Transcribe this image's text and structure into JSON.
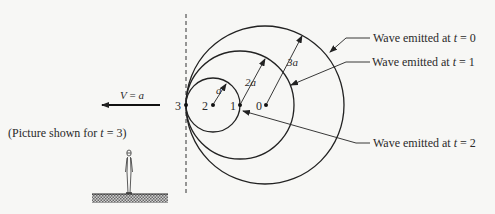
{
  "diagram": {
    "observer_line": {
      "x": 186,
      "y1": 14,
      "y2": 196
    },
    "waves": [
      {
        "t": 0,
        "center_label": "0",
        "cx": 265,
        "cy": 105,
        "r": 79,
        "radius_label": "3a",
        "caption": "Wave emitted at t = 0"
      },
      {
        "t": 1,
        "center_label": "1",
        "cx": 240,
        "cy": 105,
        "r": 54,
        "radius_label": "2a",
        "caption": "Wave emitted at t = 1"
      },
      {
        "t": 2,
        "center_label": "2",
        "cx": 213,
        "cy": 105,
        "r": 27,
        "radius_label": "a",
        "caption": "Wave emitted at t = 2"
      }
    ],
    "current_point_label": "3",
    "velocity_label": "V = a",
    "note": "(Picture shown for t = 3)",
    "captions": {
      "t0": {
        "prefix": "Wave emitted at ",
        "var": "t",
        "suffix": " = 0"
      },
      "t1": {
        "prefix": "Wave emitted at ",
        "var": "t",
        "suffix": " = 1"
      },
      "t2": {
        "prefix": "Wave emitted at ",
        "var": "t",
        "suffix": " = 2"
      }
    },
    "labels": {
      "p0": "0",
      "p1": "1",
      "p2": "2",
      "p3": "3",
      "r_a": "a",
      "r_2a": "2a",
      "r_3a": "3a",
      "v_var": "V",
      "v_eq": " = ",
      "v_val": "a",
      "note_prefix": "(Picture shown for ",
      "note_var": "t",
      "note_suffix": " = 3)"
    }
  }
}
